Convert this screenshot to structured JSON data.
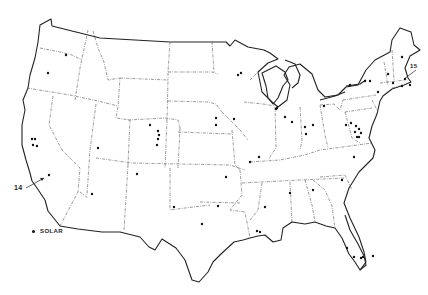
{
  "map": {
    "title": "",
    "region": "Contiguous United States",
    "legend": {
      "items": [
        {
          "symbol": "dot",
          "label": "SOLAR"
        }
      ]
    },
    "callouts": [
      {
        "label": "14",
        "location": "Southern California"
      },
      {
        "label": "15",
        "location": "Massachusetts / New England"
      }
    ],
    "colors": {
      "background": "#ffffff",
      "line": "#222222",
      "site": "#111111"
    },
    "sites": [
      {
        "x": 48,
        "y": 73
      },
      {
        "x": 66,
        "y": 55
      },
      {
        "x": 32,
        "y": 139
      },
      {
        "x": 35,
        "y": 139
      },
      {
        "x": 33,
        "y": 145
      },
      {
        "x": 37,
        "y": 146
      },
      {
        "x": 49,
        "y": 175
      },
      {
        "x": 98,
        "y": 148
      },
      {
        "x": 92,
        "y": 194
      },
      {
        "x": 150,
        "y": 125
      },
      {
        "x": 158,
        "y": 131
      },
      {
        "x": 159,
        "y": 135
      },
      {
        "x": 158,
        "y": 139
      },
      {
        "x": 157,
        "y": 145
      },
      {
        "x": 137,
        "y": 174
      },
      {
        "x": 174,
        "y": 207
      },
      {
        "x": 202,
        "y": 224
      },
      {
        "x": 218,
        "y": 206
      },
      {
        "x": 226,
        "y": 177
      },
      {
        "x": 216,
        "y": 125
      },
      {
        "x": 234,
        "y": 119
      },
      {
        "x": 238,
        "y": 75
      },
      {
        "x": 241,
        "y": 73
      },
      {
        "x": 216,
        "y": 118
      },
      {
        "x": 250,
        "y": 162
      },
      {
        "x": 259,
        "y": 157
      },
      {
        "x": 265,
        "y": 207
      },
      {
        "x": 277,
        "y": 108
      },
      {
        "x": 276,
        "y": 109
      },
      {
        "x": 285,
        "y": 117
      },
      {
        "x": 292,
        "y": 122
      },
      {
        "x": 305,
        "y": 127
      },
      {
        "x": 313,
        "y": 125
      },
      {
        "x": 306,
        "y": 134
      },
      {
        "x": 324,
        "y": 106
      },
      {
        "x": 290,
        "y": 193
      },
      {
        "x": 313,
        "y": 190
      },
      {
        "x": 342,
        "y": 180
      },
      {
        "x": 354,
        "y": 157
      },
      {
        "x": 350,
        "y": 85
      },
      {
        "x": 365,
        "y": 81
      },
      {
        "x": 370,
        "y": 81
      },
      {
        "x": 378,
        "y": 92
      },
      {
        "x": 346,
        "y": 125
      },
      {
        "x": 351,
        "y": 123
      },
      {
        "x": 356,
        "y": 126
      },
      {
        "x": 359,
        "y": 129
      },
      {
        "x": 361,
        "y": 133
      },
      {
        "x": 359,
        "y": 137
      },
      {
        "x": 357,
        "y": 137
      },
      {
        "x": 355,
        "y": 132
      },
      {
        "x": 388,
        "y": 74
      },
      {
        "x": 402,
        "y": 57
      },
      {
        "x": 393,
        "y": 83
      },
      {
        "x": 405,
        "y": 79
      },
      {
        "x": 402,
        "y": 86
      },
      {
        "x": 410,
        "y": 85
      },
      {
        "x": 354,
        "y": 257
      },
      {
        "x": 363,
        "y": 257
      },
      {
        "x": 361,
        "y": 258
      },
      {
        "x": 373,
        "y": 256
      },
      {
        "x": 347,
        "y": 248
      },
      {
        "x": 257,
        "y": 231
      },
      {
        "x": 260,
        "y": 232
      }
    ]
  }
}
